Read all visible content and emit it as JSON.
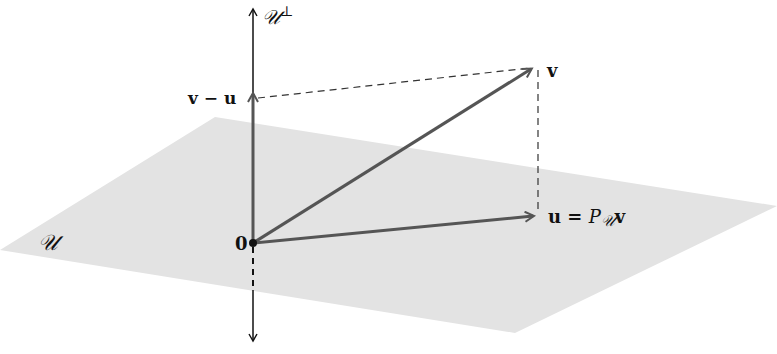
{
  "diagram": {
    "colors": {
      "plane": "#e3e3e3",
      "vector": "#555555",
      "axis": "#111111",
      "dashed": "#333333",
      "background": "#ffffff"
    },
    "labels": {
      "perp_axis": "𝒰",
      "perp_sup": "⊥",
      "plane": "𝒰",
      "origin": "0",
      "v": "v",
      "v_minus_u": "v − u",
      "u_eq": "u = ",
      "proj_P": "P",
      "proj_sub": "𝒰",
      "proj_v": "v"
    },
    "points": {
      "origin": [
        253,
        243
      ],
      "v": [
        533,
        67
      ],
      "u": [
        535,
        216
      ],
      "v_minus_u": [
        253,
        92
      ]
    }
  }
}
